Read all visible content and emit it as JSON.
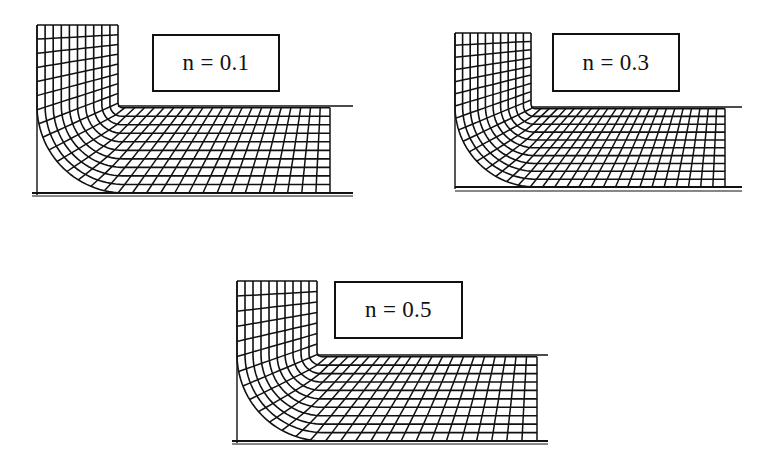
{
  "figure": {
    "colors": {
      "ink": "#111111",
      "background": "#ffffff"
    },
    "panels": [
      {
        "id": "panel-n01",
        "label": "n = 0.1",
        "n": 0.1,
        "label_box": {
          "x": 152,
          "y": 34,
          "w": 128,
          "h": 58
        },
        "column": {
          "x0": 37,
          "x1": 118,
          "top": 25
        },
        "channel": {
          "top": 106,
          "bottom": 193,
          "mesh_right": 330,
          "die_end": 353
        },
        "base_line": {
          "x0": 32,
          "x1": 353,
          "y": 196
        },
        "cols": 10,
        "rows": 11,
        "flow_lines": 11,
        "cross_lines": 30
      },
      {
        "id": "panel-n03",
        "label": "n = 0.3",
        "n": 0.3,
        "label_box": {
          "x": 552,
          "y": 33,
          "w": 128,
          "h": 59
        },
        "column": {
          "x0": 455,
          "x1": 531,
          "top": 33
        },
        "channel": {
          "top": 107,
          "bottom": 187,
          "mesh_right": 725,
          "die_end": 742
        },
        "base_line": {
          "x0": 455,
          "x1": 742,
          "y": 191
        },
        "cols": 10,
        "rows": 10,
        "flow_lines": 11,
        "cross_lines": 32
      },
      {
        "id": "panel-n05",
        "label": "n = 0.5",
        "n": 0.5,
        "label_box": {
          "x": 334,
          "y": 281,
          "w": 129,
          "h": 58
        },
        "column": {
          "x0": 237,
          "x1": 317,
          "top": 281
        },
        "channel": {
          "top": 355,
          "bottom": 441,
          "mesh_right": 537,
          "die_end": 548
        },
        "base_line": {
          "x0": 232,
          "x1": 548,
          "y": 444
        },
        "cols": 10,
        "rows": 10,
        "flow_lines": 11,
        "cross_lines": 28
      }
    ]
  }
}
